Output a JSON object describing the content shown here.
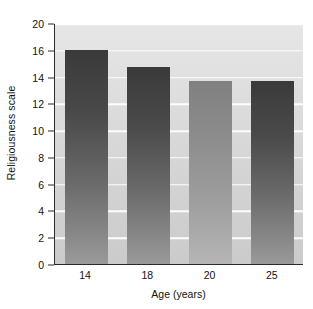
{
  "chart_data": {
    "type": "bar",
    "title": "",
    "xlabel": "Age (years)",
    "ylabel": "Religiousness scale",
    "categories": [
      "14",
      "18",
      "20",
      "25"
    ],
    "values": [
      16.0,
      14.7,
      13.7,
      13.7
    ],
    "series": [
      {
        "name": "Religiousness scale",
        "values": [
          16.0,
          14.7,
          13.7,
          13.7
        ]
      }
    ],
    "ylim": [
      0,
      20
    ],
    "xlim_categories": 4,
    "ytick_labels": [
      "0",
      "2",
      "4",
      "6",
      "8",
      "10",
      "12",
      "14",
      "16",
      "20"
    ],
    "ytick_values": [
      0,
      2,
      4,
      6,
      8,
      10,
      12,
      14,
      16,
      20
    ],
    "grid": "horizontal",
    "legend": "none",
    "legend_position": "none",
    "bar_styles": [
      "dark",
      "dark",
      "light",
      "dark"
    ],
    "colors": {
      "bar_dark_top": "#3a3a3a",
      "bar_dark_bottom": "#9a9a9a",
      "bar_light_top": "#808080",
      "bar_light_bottom": "#b5b5b5",
      "plot_background_top": "#e6e6e6",
      "plot_background_bottom": "#cbcbcb",
      "gridline": "#fdfdfd",
      "axis": "#2b2b2b",
      "text": "#111111",
      "figure_background": "#ffffff"
    }
  }
}
